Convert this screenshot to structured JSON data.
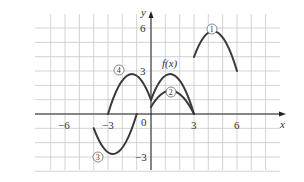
{
  "chart_data": {
    "type": "line",
    "title": "",
    "xlabel": "x",
    "ylabel": "y",
    "xlim": [
      -7.5,
      8.5
    ],
    "ylim": [
      -4.5,
      7
    ],
    "grid": true,
    "x_ticks": [
      -6,
      -3,
      0,
      3,
      6
    ],
    "y_ticks": [
      -3,
      3,
      6
    ],
    "tick_labels": {
      "x": [
        "−6",
        "−3",
        "0",
        "3",
        "6"
      ],
      "y": [
        "6",
        "3",
        "−3"
      ]
    },
    "series": [
      {
        "name": "f(x)",
        "label": "f(x)",
        "points": [
          [
            0,
            1
          ],
          [
            1.5,
            3
          ],
          [
            3,
            0
          ]
        ]
      },
      {
        "name": "1",
        "label": "①",
        "points": [
          [
            3,
            4
          ],
          [
            4.5,
            6
          ],
          [
            6,
            3
          ]
        ]
      },
      {
        "name": "2",
        "label": "②",
        "points": [
          [
            0,
            0.5
          ],
          [
            1.5,
            1.5
          ],
          [
            3,
            0
          ]
        ]
      },
      {
        "name": "3",
        "label": "③",
        "points": [
          [
            -4,
            -1
          ],
          [
            -2.5,
            -3
          ],
          [
            -1,
            0
          ]
        ]
      },
      {
        "name": "4",
        "label": "④",
        "points": [
          [
            -3,
            0
          ],
          [
            -1.5,
            3
          ],
          [
            0,
            1
          ]
        ]
      }
    ]
  },
  "labels": {
    "x_axis": "x",
    "y_axis": "y",
    "fx": "f(x)",
    "c1": "1",
    "c2": "2",
    "c3": "3",
    "c4": "4",
    "t_x_m6": "−6",
    "t_x_m3": "−3",
    "t_0": "0",
    "t_x_3": "3",
    "t_x_6": "6",
    "t_y_6": "6",
    "t_y_3": "3",
    "t_y_m3": "−3"
  }
}
